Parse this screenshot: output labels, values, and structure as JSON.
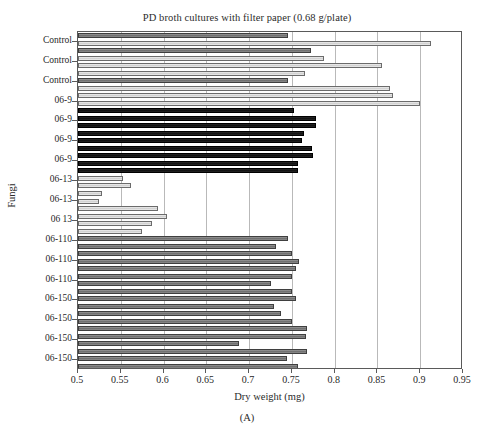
{
  "figure": {
    "panel_caption": "(A)",
    "title": "PD broth cultures with filter paper (0.68 g/plate)"
  },
  "axes": {
    "xlabel": "Dry weight (mg)",
    "ylabel": "Fungi",
    "xticks": [
      "0.5",
      "0.55",
      "0.6",
      "0.65",
      "0.7",
      "0.75",
      "0.8",
      "0.85",
      "0.9",
      "0.95"
    ]
  },
  "chart_data": {
    "type": "bar",
    "orientation": "horizontal",
    "title": "PD broth cultures with filter paper (0.68 g/plate)",
    "xlabel": "Dry weight (mg)",
    "ylabel": "Fungi",
    "xlim": [
      0.5,
      0.95
    ],
    "xticks": [
      0.5,
      0.55,
      0.6,
      0.65,
      0.7,
      0.75,
      0.8,
      0.85,
      0.9,
      0.95
    ],
    "grid": true,
    "legend": false,
    "categories": [
      "Control",
      "Control",
      "Control",
      "06-9",
      "06-9",
      "06-9",
      "06-9",
      "06-13",
      "06-13",
      "06 13",
      "06-110",
      "06-110",
      "06-110",
      "06-150",
      "06-150",
      "06-150",
      "06-150"
    ],
    "bars": [
      {
        "group": "Control",
        "value": 0.745,
        "shade": "mid"
      },
      {
        "group": "Control",
        "value": 0.912,
        "shade": "light"
      },
      {
        "group": "Control",
        "value": 0.772,
        "shade": "mid"
      },
      {
        "group": "Control",
        "value": 0.787,
        "shade": "light"
      },
      {
        "group": "Control",
        "value": 0.855,
        "shade": "light"
      },
      {
        "group": "Control",
        "value": 0.765,
        "shade": "light"
      },
      {
        "group": "Control",
        "value": 0.745,
        "shade": "mid"
      },
      {
        "group": "Control",
        "value": 0.865,
        "shade": "light"
      },
      {
        "group": "06-9",
        "value": 0.868,
        "shade": "light"
      },
      {
        "group": "06-9",
        "value": 0.9,
        "shade": "light"
      },
      {
        "group": "06-9",
        "value": 0.752,
        "shade": "dark"
      },
      {
        "group": "06-9",
        "value": 0.778,
        "shade": "dark"
      },
      {
        "group": "06-9",
        "value": 0.778,
        "shade": "dark"
      },
      {
        "group": "06-9",
        "value": 0.764,
        "shade": "dark"
      },
      {
        "group": "06-9",
        "value": 0.762,
        "shade": "dark"
      },
      {
        "group": "06-9",
        "value": 0.774,
        "shade": "dark"
      },
      {
        "group": "06-9",
        "value": 0.775,
        "shade": "dark"
      },
      {
        "group": "06-9",
        "value": 0.757,
        "shade": "dark"
      },
      {
        "group": "06-9",
        "value": 0.757,
        "shade": "dark"
      },
      {
        "group": "06-13",
        "value": 0.552,
        "shade": "light"
      },
      {
        "group": "06-13",
        "value": 0.562,
        "shade": "light"
      },
      {
        "group": "06-13",
        "value": 0.528,
        "shade": "light"
      },
      {
        "group": "06-13",
        "value": 0.524,
        "shade": "light"
      },
      {
        "group": "06-13",
        "value": 0.593,
        "shade": "light"
      },
      {
        "group": "06-13",
        "value": 0.604,
        "shade": "light"
      },
      {
        "group": "06 13",
        "value": 0.586,
        "shade": "light"
      },
      {
        "group": "06 13",
        "value": 0.575,
        "shade": "light"
      },
      {
        "group": "06-110",
        "value": 0.745,
        "shade": "mid"
      },
      {
        "group": "06-110",
        "value": 0.731,
        "shade": "mid"
      },
      {
        "group": "06-110",
        "value": 0.75,
        "shade": "mid"
      },
      {
        "group": "06-110",
        "value": 0.758,
        "shade": "mid"
      },
      {
        "group": "06-110",
        "value": 0.755,
        "shade": "mid"
      },
      {
        "group": "06-110",
        "value": 0.75,
        "shade": "mid"
      },
      {
        "group": "06-110",
        "value": 0.726,
        "shade": "mid"
      },
      {
        "group": "06-110",
        "value": 0.75,
        "shade": "mid"
      },
      {
        "group": "06-150",
        "value": 0.755,
        "shade": "mid"
      },
      {
        "group": "06-150",
        "value": 0.729,
        "shade": "mid"
      },
      {
        "group": "06-150",
        "value": 0.737,
        "shade": "mid"
      },
      {
        "group": "06-150",
        "value": 0.75,
        "shade": "mid"
      },
      {
        "group": "06-150",
        "value": 0.768,
        "shade": "mid"
      },
      {
        "group": "06-150",
        "value": 0.767,
        "shade": "mid"
      },
      {
        "group": "06-150",
        "value": 0.688,
        "shade": "mid"
      },
      {
        "group": "06-150",
        "value": 0.768,
        "shade": "mid"
      },
      {
        "group": "06-150",
        "value": 0.744,
        "shade": "mid"
      },
      {
        "group": "06-150",
        "value": 0.757,
        "shade": "mid"
      }
    ]
  }
}
